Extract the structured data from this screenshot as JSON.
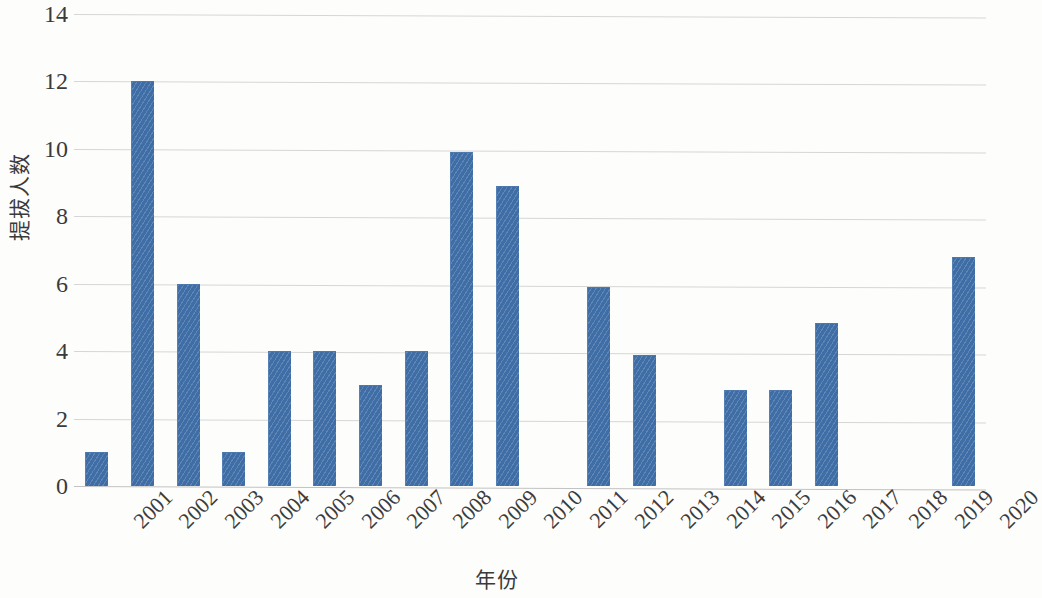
{
  "chart_data": {
    "type": "bar",
    "title": "",
    "xlabel": "年份",
    "ylabel": "提拔人数",
    "categories": [
      "2001",
      "2002",
      "2003",
      "2004",
      "2005",
      "2006",
      "2007",
      "2008",
      "2009",
      "2010",
      "2011",
      "2012",
      "2013",
      "2014",
      "2015",
      "2016",
      "2017",
      "2018",
      "2019",
      "2020"
    ],
    "values": [
      1,
      12,
      6,
      1,
      4,
      4,
      3,
      4,
      9.9,
      8.9,
      0,
      5.9,
      3.9,
      0,
      2.85,
      2.85,
      4.85,
      0,
      0,
      6.8
    ],
    "series": [
      {
        "name": "提拔人数",
        "values": [
          1,
          12,
          6,
          1,
          4,
          4,
          3,
          4,
          9.9,
          8.9,
          0,
          5.9,
          3.9,
          0,
          2.85,
          2.85,
          4.85,
          0,
          0,
          6.8
        ]
      }
    ],
    "ylim": [
      0,
      14
    ],
    "ytick_step": 2,
    "ytick_labels": [
      "0",
      "2",
      "4",
      "6",
      "8",
      "10",
      "12",
      "14"
    ],
    "ytick_values": [
      0,
      2,
      4,
      6,
      8,
      10,
      12,
      14
    ],
    "xtick_rotation_deg": -45,
    "grid": true,
    "grid_axis": "y",
    "legend": false,
    "bar_color": "#3f6da6",
    "grid_color": "#d6d6d6",
    "background_color": "#fdfdfb",
    "text_color": "#3b3b3b"
  }
}
